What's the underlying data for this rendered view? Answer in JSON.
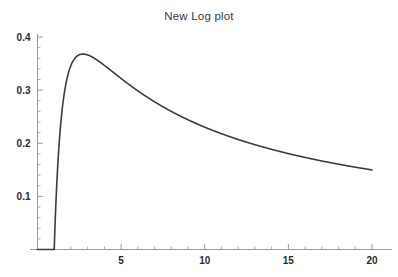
{
  "chart_data": {
    "type": "line",
    "title": "New Log plot",
    "xlabel": "",
    "ylabel": "",
    "xlim": [
      0,
      20.6
    ],
    "ylim": [
      0,
      0.425
    ],
    "grid": false,
    "legend": null,
    "xticks": [
      5,
      10,
      15,
      20
    ],
    "xtick_labels": [
      "5",
      "10",
      "15",
      "20"
    ],
    "yticks": [
      0.1,
      0.2,
      0.3,
      0.4
    ],
    "ytick_labels": [
      "0.1",
      "0.2",
      "0.3",
      "0.4"
    ],
    "minor_ticks_per_interval": 4,
    "function": "log(x)/x",
    "peak": {
      "x": 2.718,
      "y": 0.368
    },
    "line_color": "#3c3c3c",
    "line_width": 1.6,
    "axis_color": "#9a9a9a",
    "background": "#ffffff",
    "series": [
      {
        "name": "log(x)/x",
        "x": [
          0.22,
          0.3,
          0.4,
          0.5,
          0.6,
          0.7,
          0.8,
          0.9,
          1.0,
          1.1,
          1.2,
          1.3,
          1.4,
          1.5,
          1.6,
          1.8,
          2.0,
          2.2,
          2.4,
          2.6,
          2.718,
          2.9,
          3.2,
          3.5,
          4.0,
          4.5,
          5.0,
          5.5,
          6.0,
          6.5,
          7.0,
          7.5,
          8.0,
          9.0,
          10.0,
          11.0,
          12.0,
          13.0,
          14.0,
          15.0,
          16.0,
          17.0,
          18.0,
          19.0,
          20.0
        ],
        "y": [
          -6.88,
          -4.01,
          -2.29,
          -1.386,
          -0.851,
          -0.509,
          -0.279,
          -0.117,
          0.0,
          0.0867,
          0.1519,
          0.2018,
          0.2403,
          0.2703,
          0.2938,
          0.3265,
          0.3466,
          0.3584,
          0.3647,
          0.3675,
          0.3679,
          0.3671,
          0.3636,
          0.3579,
          0.3466,
          0.3343,
          0.3219,
          0.31,
          0.2986,
          0.288,
          0.278,
          0.2687,
          0.2599,
          0.2441,
          0.2303,
          0.218,
          0.2071,
          0.1973,
          0.1885,
          0.1805,
          0.1733,
          0.1667,
          0.1606,
          0.1549,
          0.1498
        ]
      }
    ]
  },
  "plot": {
    "title": "New Log plot"
  }
}
